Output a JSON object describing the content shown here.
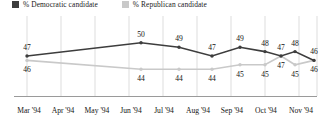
{
  "legend": {
    "items": [
      {
        "label": "% Democratic candidate",
        "color": "#3d3d3d",
        "key": "democratic"
      },
      {
        "label": "% Republican candidate",
        "color": "#c9c9c9",
        "key": "republican"
      }
    ]
  },
  "chart_data": {
    "type": "line",
    "title": "",
    "xlabel": "",
    "ylabel": "",
    "grid": true,
    "legend_position": "top-left",
    "ylim": [
      42,
      52
    ],
    "categories": [
      "Mar '94",
      "Jun '94",
      "Jul '94",
      "Aug '94",
      "Sep '94",
      "Oct '94 (1)",
      "Oct '94 (2)",
      "Oct '94 (3)",
      "Nov '94"
    ],
    "x": [
      27,
      141,
      179,
      212,
      240,
      265,
      281,
      295,
      314
    ],
    "series": [
      {
        "name": "% Democratic candidate",
        "color": "#3d3d3d",
        "values": [
          47,
          50,
          49,
          47,
          49,
          48,
          47,
          48,
          46
        ],
        "label_position": "above"
      },
      {
        "name": "% Republican candidate",
        "color": "#c9c9c9",
        "values": [
          46,
          44,
          44,
          44,
          45,
          45,
          47,
          45,
          46
        ],
        "label_position": "below"
      }
    ],
    "xaxis_ticks": [
      {
        "label": "Mar '94",
        "x": 29
      },
      {
        "label": "Apr '94",
        "x": 63
      },
      {
        "label": "May '94",
        "x": 97
      },
      {
        "label": "Jun '94",
        "x": 131
      },
      {
        "label": "Jul '94",
        "x": 164
      },
      {
        "label": "Aug '94",
        "x": 198
      },
      {
        "label": "Sep '94",
        "x": 232
      },
      {
        "label": "Oct '94",
        "x": 266
      },
      {
        "label": "Nov '94",
        "x": 301
      }
    ],
    "gridlines_x": [
      27,
      61,
      95,
      129,
      163,
      197,
      231,
      265,
      299,
      317
    ]
  }
}
